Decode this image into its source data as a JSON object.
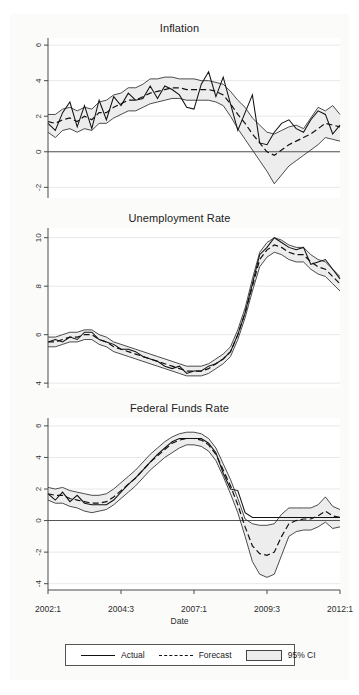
{
  "figure": {
    "xaxis_title": "Date",
    "xtick_labels": [
      "2002:1",
      "2004:3",
      "2007:1",
      "2009:3",
      "2012:1"
    ],
    "xtick_values": [
      2002.0,
      2004.5,
      2007.0,
      2009.5,
      2012.0
    ],
    "legend": {
      "items": [
        {
          "label": "Actual",
          "style": "solid",
          "icon": "solid-line-icon"
        },
        {
          "label": "Forecast",
          "style": "dashed",
          "icon": "dashed-line-icon"
        },
        {
          "label": "95% CI",
          "style": "band",
          "icon": "shaded-band-icon"
        }
      ]
    },
    "colors": {
      "actual": "#111111",
      "forecast": "#111111",
      "ci_band": "#ececec",
      "ci_edge": "#1f1f1f",
      "axis": "#4a4a4a",
      "grid": "#e8e8e8",
      "zero": "#555555",
      "background": "#fbfbfa",
      "plot_background": "#ffffff"
    }
  },
  "chart_data": [
    {
      "type": "line",
      "title": "Inflation",
      "xlabel": "Date",
      "ylabel": "",
      "xlim": [
        2002.0,
        2012.0
      ],
      "ylim": [
        -2.6,
        6.4
      ],
      "yticks": [
        -2,
        0,
        2,
        4,
        6
      ],
      "ytick_labels": [
        "-2",
        "0",
        "2",
        "4",
        "6"
      ],
      "grid": true,
      "zero_line": 0,
      "legend_position": "bottom-figure",
      "x": [
        2002.0,
        2002.25,
        2002.5,
        2002.75,
        2003.0,
        2003.25,
        2003.5,
        2003.75,
        2004.0,
        2004.25,
        2004.5,
        2004.75,
        2005.0,
        2005.25,
        2005.5,
        2005.75,
        2006.0,
        2006.25,
        2006.5,
        2006.75,
        2007.0,
        2007.25,
        2007.5,
        2007.75,
        2008.0,
        2008.25,
        2008.5,
        2008.75,
        2009.0,
        2009.25,
        2009.5,
        2009.75,
        2010.0,
        2010.25,
        2010.5,
        2010.75,
        2011.0,
        2011.25,
        2011.5,
        2011.75,
        2012.0
      ],
      "series": [
        {
          "name": "Actual",
          "style": "solid",
          "values": [
            1.6,
            1.2,
            2.2,
            2.8,
            1.4,
            2.6,
            1.3,
            2.9,
            1.8,
            3.1,
            2.6,
            3.3,
            2.9,
            3.0,
            3.7,
            3.0,
            3.7,
            3.5,
            3.2,
            2.5,
            2.4,
            3.8,
            4.5,
            3.1,
            4.2,
            2.7,
            1.2,
            2.2,
            3.2,
            0.5,
            0.4,
            1.1,
            1.6,
            1.8,
            1.3,
            1.1,
            1.8,
            2.3,
            2.1,
            1.0,
            1.5
          ]
        },
        {
          "name": "Forecast",
          "style": "dashed",
          "values": [
            1.7,
            1.6,
            1.8,
            1.9,
            1.7,
            2.0,
            1.8,
            2.2,
            2.2,
            2.5,
            2.7,
            2.9,
            2.9,
            3.1,
            3.3,
            3.4,
            3.5,
            3.6,
            3.6,
            3.5,
            3.5,
            3.5,
            3.5,
            3.4,
            3.2,
            2.7,
            2.1,
            1.6,
            1.0,
            0.5,
            0.0,
            -0.2,
            0.1,
            0.4,
            0.6,
            0.8,
            1.0,
            1.3,
            1.6,
            1.5,
            1.4
          ]
        },
        {
          "name": "CI Upper",
          "style": "ci-edge",
          "values": [
            2.1,
            2.1,
            2.4,
            2.5,
            2.3,
            2.5,
            2.4,
            2.8,
            2.9,
            3.2,
            3.3,
            3.6,
            3.6,
            3.8,
            4.1,
            4.1,
            4.2,
            4.2,
            4.1,
            4.1,
            4.1,
            4.0,
            4.0,
            3.9,
            3.8,
            3.4,
            2.9,
            2.5,
            1.9,
            1.5,
            1.1,
            1.0,
            1.2,
            1.4,
            1.5,
            1.3,
            1.9,
            2.5,
            2.3,
            2.6,
            2.1
          ]
        },
        {
          "name": "CI Lower",
          "style": "ci-edge",
          "values": [
            1.1,
            0.8,
            1.2,
            1.3,
            1.1,
            1.3,
            1.2,
            1.6,
            1.6,
            1.9,
            2.1,
            2.3,
            2.3,
            2.5,
            2.7,
            2.8,
            2.9,
            3.0,
            3.0,
            2.9,
            2.9,
            2.9,
            2.9,
            2.8,
            2.6,
            2.0,
            1.3,
            0.7,
            0.1,
            -0.5,
            -1.1,
            -1.8,
            -1.3,
            -0.8,
            -0.5,
            -0.2,
            0.1,
            0.4,
            0.8,
            0.7,
            0.6
          ]
        }
      ]
    },
    {
      "type": "line",
      "title": "Unemployment Rate",
      "xlabel": "Date",
      "ylabel": "",
      "xlim": [
        2002.0,
        2012.0
      ],
      "ylim": [
        3.8,
        10.4
      ],
      "yticks": [
        4,
        6,
        8,
        10
      ],
      "ytick_labels": [
        "4",
        "6",
        "8",
        "10"
      ],
      "grid": true,
      "zero_line": null,
      "legend_position": "bottom-figure",
      "x": [
        2002.0,
        2002.25,
        2002.5,
        2002.75,
        2003.0,
        2003.25,
        2003.5,
        2003.75,
        2004.0,
        2004.25,
        2004.5,
        2004.75,
        2005.0,
        2005.25,
        2005.5,
        2005.75,
        2006.0,
        2006.25,
        2006.5,
        2006.75,
        2007.0,
        2007.25,
        2007.5,
        2007.75,
        2008.0,
        2008.25,
        2008.5,
        2008.75,
        2009.0,
        2009.25,
        2009.5,
        2009.75,
        2010.0,
        2010.25,
        2010.5,
        2010.75,
        2011.0,
        2011.25,
        2011.5,
        2011.75,
        2012.0
      ],
      "series": [
        {
          "name": "Actual",
          "style": "solid",
          "values": [
            5.7,
            5.8,
            5.7,
            5.9,
            5.8,
            6.1,
            6.1,
            5.8,
            5.7,
            5.6,
            5.4,
            5.4,
            5.3,
            5.1,
            5.0,
            4.9,
            4.7,
            4.6,
            4.7,
            4.4,
            4.5,
            4.5,
            4.7,
            4.8,
            5.0,
            5.3,
            6.0,
            6.9,
            8.1,
            9.3,
            9.6,
            10.0,
            9.8,
            9.6,
            9.5,
            9.6,
            8.9,
            9.0,
            9.1,
            8.7,
            8.3
          ]
        },
        {
          "name": "Forecast",
          "style": "dashed",
          "values": [
            5.7,
            5.7,
            5.8,
            5.9,
            5.9,
            6.0,
            6.0,
            5.8,
            5.7,
            5.5,
            5.4,
            5.3,
            5.2,
            5.1,
            5.0,
            4.9,
            4.8,
            4.7,
            4.6,
            4.5,
            4.5,
            4.5,
            4.6,
            4.8,
            5.0,
            5.3,
            6.0,
            6.9,
            8.0,
            9.1,
            9.5,
            9.7,
            9.6,
            9.4,
            9.3,
            9.3,
            9.0,
            8.8,
            8.7,
            8.4,
            8.1
          ]
        },
        {
          "name": "CI Upper",
          "style": "ci-edge",
          "values": [
            5.9,
            5.9,
            6.0,
            6.1,
            6.1,
            6.2,
            6.2,
            6.0,
            5.9,
            5.7,
            5.6,
            5.5,
            5.4,
            5.3,
            5.2,
            5.1,
            5.0,
            4.9,
            4.8,
            4.7,
            4.7,
            4.7,
            4.8,
            5.0,
            5.2,
            5.5,
            6.2,
            7.1,
            8.3,
            9.4,
            9.8,
            10.0,
            9.9,
            9.7,
            9.6,
            9.6,
            9.3,
            9.1,
            9.0,
            8.7,
            8.4
          ]
        },
        {
          "name": "CI Lower",
          "style": "ci-edge",
          "values": [
            5.5,
            5.5,
            5.6,
            5.7,
            5.7,
            5.8,
            5.8,
            5.6,
            5.5,
            5.3,
            5.2,
            5.1,
            5.0,
            4.9,
            4.8,
            4.7,
            4.6,
            4.5,
            4.4,
            4.3,
            4.3,
            4.3,
            4.4,
            4.6,
            4.8,
            5.1,
            5.8,
            6.7,
            7.8,
            8.8,
            9.2,
            9.4,
            9.3,
            9.1,
            9.0,
            9.0,
            8.7,
            8.5,
            8.4,
            8.1,
            7.8
          ]
        }
      ]
    },
    {
      "type": "line",
      "title": "Federal Funds Rate",
      "xlabel": "Date",
      "ylabel": "",
      "xlim": [
        2002.0,
        2012.0
      ],
      "ylim": [
        -4.4,
        6.5
      ],
      "yticks": [
        -4,
        -2,
        0,
        2,
        4,
        6
      ],
      "ytick_labels": [
        "-4",
        "-2",
        "0",
        "2",
        "4",
        "6"
      ],
      "grid": true,
      "zero_line": 0,
      "legend_position": "bottom-figure",
      "x": [
        2002.0,
        2002.25,
        2002.5,
        2002.75,
        2003.0,
        2003.25,
        2003.5,
        2003.75,
        2004.0,
        2004.25,
        2004.5,
        2004.75,
        2005.0,
        2005.25,
        2005.5,
        2005.75,
        2006.0,
        2006.25,
        2006.5,
        2006.75,
        2007.0,
        2007.25,
        2007.5,
        2007.75,
        2008.0,
        2008.25,
        2008.5,
        2008.75,
        2009.0,
        2009.25,
        2009.5,
        2009.75,
        2010.0,
        2010.25,
        2010.5,
        2010.75,
        2011.0,
        2011.25,
        2011.5,
        2011.75,
        2012.0
      ],
      "series": [
        {
          "name": "Actual",
          "style": "solid",
          "values": [
            1.7,
            1.3,
            1.8,
            1.2,
            1.6,
            1.1,
            1.0,
            1.0,
            1.0,
            1.3,
            1.8,
            2.3,
            2.7,
            3.2,
            3.7,
            4.2,
            4.6,
            5.0,
            5.2,
            5.2,
            5.2,
            5.2,
            4.9,
            4.3,
            3.0,
            2.0,
            1.9,
            0.5,
            0.2,
            0.2,
            0.2,
            0.2,
            0.2,
            0.2,
            0.2,
            0.2,
            0.2,
            0.2,
            0.2,
            0.2,
            0.2
          ]
        },
        {
          "name": "Forecast",
          "style": "dashed",
          "values": [
            1.7,
            1.6,
            1.6,
            1.4,
            1.3,
            1.2,
            1.1,
            1.1,
            1.2,
            1.5,
            1.9,
            2.3,
            2.7,
            3.2,
            3.7,
            4.1,
            4.5,
            4.9,
            5.1,
            5.2,
            5.2,
            5.1,
            4.8,
            4.2,
            3.2,
            2.2,
            1.0,
            -0.4,
            -1.6,
            -2.1,
            -2.2,
            -2.0,
            -1.0,
            -0.2,
            0.0,
            0.1,
            0.1,
            0.3,
            0.6,
            0.3,
            0.2
          ]
        },
        {
          "name": "CI Upper",
          "style": "ci-edge",
          "values": [
            2.1,
            2.0,
            2.1,
            1.9,
            1.8,
            1.7,
            1.6,
            1.6,
            1.7,
            2.0,
            2.4,
            2.8,
            3.2,
            3.7,
            4.2,
            4.6,
            5.0,
            5.3,
            5.5,
            5.6,
            5.6,
            5.5,
            5.2,
            4.6,
            3.6,
            2.6,
            1.4,
            0.1,
            -0.2,
            -0.3,
            -0.3,
            -0.2,
            0.4,
            0.8,
            0.8,
            0.8,
            0.8,
            1.0,
            1.5,
            0.9,
            0.7
          ]
        },
        {
          "name": "CI Lower",
          "style": "ci-edge",
          "values": [
            1.3,
            1.1,
            1.1,
            0.9,
            0.8,
            0.6,
            0.5,
            0.6,
            0.7,
            1.0,
            1.4,
            1.8,
            2.2,
            2.7,
            3.2,
            3.6,
            4.0,
            4.3,
            4.6,
            4.8,
            4.8,
            4.7,
            4.4,
            3.8,
            2.8,
            1.7,
            0.5,
            -1.0,
            -2.6,
            -3.4,
            -3.6,
            -3.4,
            -2.2,
            -1.0,
            -0.7,
            -0.6,
            -0.6,
            -0.4,
            -0.1,
            -0.5,
            -0.4
          ]
        }
      ]
    }
  ]
}
